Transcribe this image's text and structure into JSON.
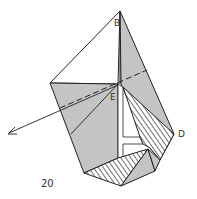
{
  "diagram": {
    "type": "origami-fold-step",
    "step_number": "20",
    "labels": {
      "B": "B",
      "E": "E",
      "D": "D"
    },
    "colors": {
      "paper": "#c4c4c4",
      "line": "#222222",
      "background": "#ffffff"
    }
  }
}
